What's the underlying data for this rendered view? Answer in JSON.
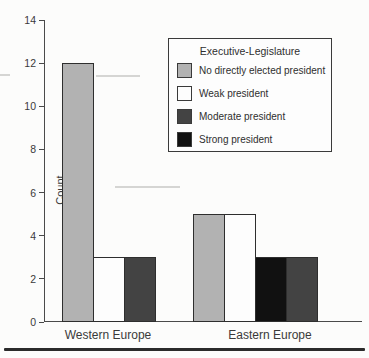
{
  "chart_data": {
    "type": "bar",
    "title": "",
    "xlabel": "",
    "ylabel": "Count",
    "ylim": [
      0,
      14
    ],
    "yticks": [
      0,
      2,
      4,
      6,
      8,
      10,
      12,
      14
    ],
    "grid": false,
    "categories": [
      "Western Europe",
      "Eastern Europe"
    ],
    "legend": {
      "title": "Executive-Legislature",
      "position": "upper-right",
      "entries": [
        {
          "label": "No directly elected president",
          "color": "#b2b2b2"
        },
        {
          "label": "Weak president",
          "color": "#fdfdfd"
        },
        {
          "label": "Moderate president",
          "color": "#434343"
        },
        {
          "label": "Strong president",
          "color": "#111111"
        }
      ]
    },
    "series": [
      {
        "name": "No directly elected president",
        "color": "#b2b2b2",
        "values": [
          12,
          5
        ]
      },
      {
        "name": "Weak president",
        "color": "#fdfdfd",
        "values": [
          3,
          5
        ]
      },
      {
        "name": "Moderate president",
        "color": "#434343",
        "values": [
          3,
          3
        ]
      },
      {
        "name": "Strong president",
        "color": "#111111",
        "values": [
          0,
          3
        ]
      }
    ],
    "groups": [
      {
        "label": "Western Europe",
        "bars": [
          {
            "series": "No directly elected president",
            "value": 12
          },
          {
            "series": "Weak president",
            "value": 3
          },
          {
            "series": "Moderate president",
            "value": 3
          }
        ]
      },
      {
        "label": "Eastern Europe",
        "bars": [
          {
            "series": "No directly elected president",
            "value": 5
          },
          {
            "series": "Weak president",
            "value": 5
          },
          {
            "series": "Strong president",
            "value": 3
          },
          {
            "series": "Moderate president",
            "value": 3
          }
        ]
      }
    ],
    "axis_color": "#4a4a4a",
    "bar_outline": "#2e2e2e"
  }
}
